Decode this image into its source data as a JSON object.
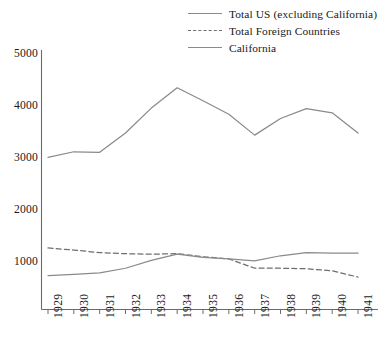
{
  "chart_data": {
    "type": "line",
    "title": "",
    "xlabel": "",
    "ylabel": "",
    "x": [
      1929,
      1930,
      1931,
      1932,
      1933,
      1934,
      1935,
      1936,
      1937,
      1938,
      1939,
      1940,
      1941
    ],
    "categories": [
      "1929",
      "1930",
      "1931",
      "1932",
      "1933",
      "1934",
      "1935",
      "1936",
      "1937",
      "1938",
      "1939",
      "1940",
      "1941"
    ],
    "ylim": [
      0,
      5000
    ],
    "yticks": [
      1000,
      2000,
      3000,
      4000,
      5000
    ],
    "ytick_labels": [
      "1000",
      "2000",
      "3000",
      "4000",
      "5000"
    ],
    "grid": false,
    "legend_position": "top-right",
    "series": [
      {
        "name": "Total US (excluding California)",
        "style": "solid",
        "color": "#8a8a8a",
        "values": [
          3010,
          3120,
          3110,
          3480,
          3960,
          4350,
          4100,
          3840,
          3440,
          3760,
          3950,
          3870,
          3480
        ]
      },
      {
        "name": "Total Foreign Countries",
        "style": "dashed",
        "color": "#6e6e6e",
        "values": [
          1270,
          1230,
          1180,
          1160,
          1150,
          1160,
          1100,
          1060,
          880,
          880,
          870,
          830,
          710
        ]
      },
      {
        "name": "California",
        "style": "solid",
        "color": "#8a8a8a",
        "values": [
          740,
          760,
          790,
          880,
          1030,
          1150,
          1090,
          1060,
          1020,
          1120,
          1180,
          1170,
          1170
        ]
      }
    ]
  },
  "legend": {
    "items": [
      {
        "label": "Total US (excluding California)",
        "style": "solid"
      },
      {
        "label": "Total Foreign Countries",
        "style": "dashed"
      },
      {
        "label": "California",
        "style": "solid"
      }
    ]
  },
  "axes": {
    "y_tick_labels": [
      "5000",
      "4000",
      "3000",
      "2000",
      "1000"
    ],
    "x_tick_labels": [
      "1929",
      "1930",
      "1931",
      "1932",
      "1933",
      "1934",
      "1935",
      "1936",
      "1937",
      "1938",
      "1939",
      "1940",
      "1941"
    ]
  }
}
